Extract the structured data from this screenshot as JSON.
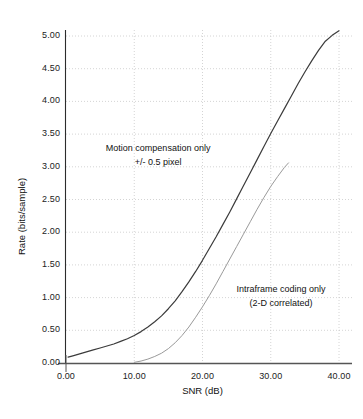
{
  "chart_data": {
    "type": "line",
    "title": "",
    "xlabel": "SNR (dB)",
    "ylabel": "Rate (bits/sample)",
    "xlim": [
      0.0,
      40.0
    ],
    "ylim": [
      0.0,
      5.0
    ],
    "xticks": [
      "0.00",
      "10.00",
      "20.00",
      "30.00",
      "40.00"
    ],
    "xtick_values": [
      0.0,
      10.0,
      20.0,
      30.0,
      40.0
    ],
    "yticks": [
      "0.00",
      "0.50",
      "1.00",
      "1.50",
      "2.00",
      "2.50",
      "3.00",
      "3.50",
      "4.00",
      "4.50",
      "5.00"
    ],
    "ytick_values": [
      0.0,
      0.5,
      1.0,
      1.5,
      2.0,
      2.5,
      3.0,
      3.5,
      4.0,
      4.5,
      5.0
    ],
    "grid": "dotted-both",
    "legend_position": "inline-annotations",
    "series": [
      {
        "name": "Motion compensation only +/- 0.5 pixel",
        "color": "#3b3b3b",
        "x": [
          0.3,
          1.0,
          2.0,
          3.0,
          4.0,
          5.0,
          6.0,
          7.0,
          8.0,
          9.0,
          10.0,
          11.0,
          12.0,
          13.0,
          14.0,
          15.0,
          16.0,
          17.0,
          18.0,
          19.0,
          20.0,
          21.0,
          22.0,
          23.0,
          24.0,
          25.0,
          26.0,
          27.0,
          28.0,
          29.0,
          30.0,
          31.0,
          32.0,
          33.0,
          34.0,
          35.0,
          36.0,
          37.0,
          38.0,
          39.0,
          40.0
        ],
        "y": [
          0.09,
          0.11,
          0.14,
          0.17,
          0.2,
          0.23,
          0.26,
          0.29,
          0.33,
          0.37,
          0.42,
          0.48,
          0.55,
          0.63,
          0.72,
          0.83,
          0.95,
          1.09,
          1.24,
          1.4,
          1.57,
          1.75,
          1.93,
          2.12,
          2.31,
          2.51,
          2.71,
          2.91,
          3.11,
          3.31,
          3.51,
          3.7,
          3.89,
          4.08,
          4.27,
          4.45,
          4.62,
          4.78,
          4.92,
          5.01,
          5.08
        ]
      },
      {
        "name": "Intraframe coding only (2-D correlated)",
        "color": "#9a9a9a",
        "x": [
          10.0,
          11.0,
          12.0,
          13.0,
          14.0,
          15.0,
          16.0,
          17.0,
          18.0,
          19.0,
          20.0,
          21.0,
          22.0,
          23.0,
          24.0,
          25.0,
          26.0,
          27.0,
          28.0,
          29.0,
          30.0,
          31.0,
          32.0,
          32.6
        ],
        "y": [
          0.01,
          0.03,
          0.06,
          0.1,
          0.15,
          0.22,
          0.31,
          0.42,
          0.55,
          0.7,
          0.86,
          1.03,
          1.21,
          1.4,
          1.59,
          1.78,
          1.97,
          2.16,
          2.35,
          2.53,
          2.7,
          2.85,
          2.99,
          3.06
        ]
      }
    ],
    "annotations": [
      {
        "name": "motion-compensation-label",
        "line1": "Motion compensation only",
        "line2": "+/- 0.5 pixel",
        "x": 13.5,
        "y": 3.27
      },
      {
        "name": "intraframe-label",
        "line1": "Intraframe coding only",
        "line2": "(2-D correlated)",
        "x": 31.5,
        "y": 1.12
      }
    ]
  }
}
